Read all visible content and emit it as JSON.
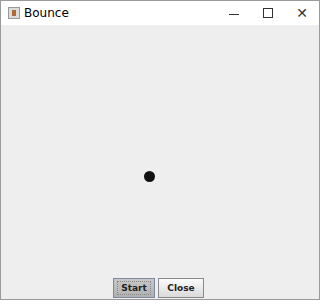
{
  "window": {
    "title": "Bounce",
    "icon": "java-cup-icon",
    "controls": {
      "minimize": "minimize-icon",
      "maximize": "maximize-icon",
      "close": "close-icon"
    }
  },
  "canvas": {
    "background": "#eeeeee",
    "ball": {
      "x": 149,
      "y": 176,
      "diameter": 11,
      "color": "#111111"
    }
  },
  "buttons": {
    "start_label": "Start",
    "close_label": "Close"
  }
}
